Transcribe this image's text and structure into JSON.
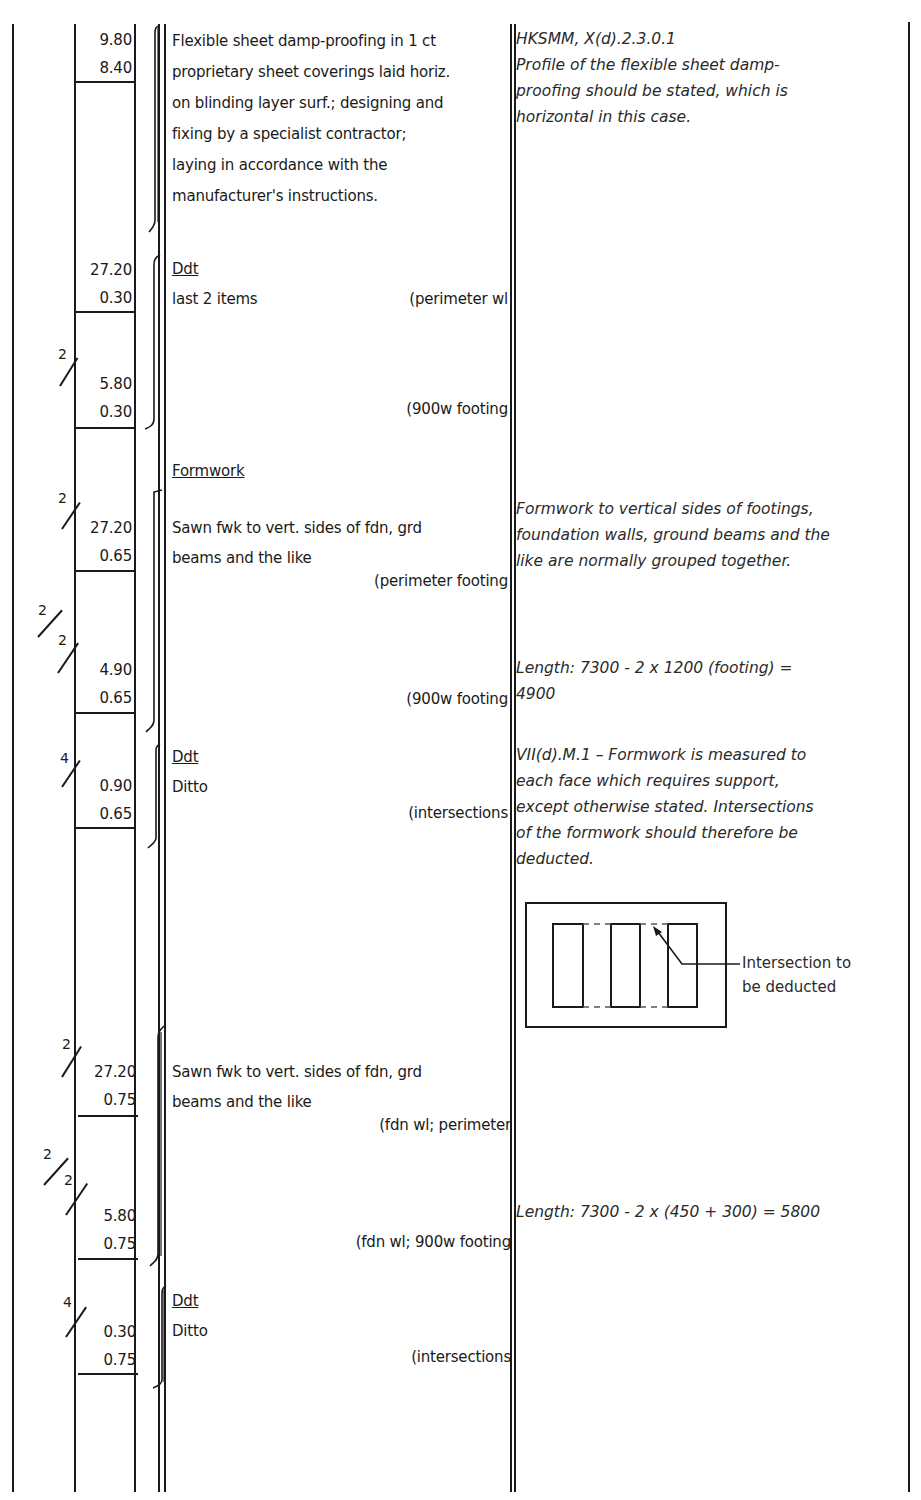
{
  "sheet": {
    "items": [
      {
        "timesing": "",
        "dims": [
          "9.80",
          "8.40"
        ],
        "heading": "",
        "description": [
          "Flexible sheet damp-proofing in 1 ct",
          "proprietary sheet coverings laid horiz.",
          "on blinding layer surf.; designing and",
          "fixing by a specialist contractor;",
          "laying in accordance with the",
          "manufacturer's instructions."
        ],
        "location": "",
        "note": [
          "HKSMM, X(d).2.3.0.1",
          "Profile of the flexible sheet damp-",
          "proofing should be stated, which is",
          "horizontal in this case."
        ]
      },
      {
        "timesing": "",
        "dims": [
          "27.20",
          "0.30"
        ],
        "heading": "Ddt",
        "description": [
          "last 2 items"
        ],
        "location": "(perimeter wl",
        "note": []
      },
      {
        "timesing": "2",
        "dims": [
          "5.80",
          "0.30"
        ],
        "heading": "",
        "description": [],
        "location": "(900w footing",
        "note": []
      },
      {
        "timesing": "2",
        "dims": [
          "27.20",
          "0.65"
        ],
        "heading": "Formwork",
        "description": [
          "Sawn fwk to vert. sides of fdn, grd",
          "beams and the like"
        ],
        "location": "(perimeter footing",
        "note": [
          "Formwork to vertical sides of footings,",
          "foundation walls, ground beams and the",
          "like are normally grouped together."
        ]
      },
      {
        "timesing": "2/2",
        "dims": [
          "4.90",
          "0.65"
        ],
        "heading": "",
        "description": [],
        "location": "(900w footing",
        "note": [
          "Length: 7300 - 2  x 1200 (footing) =",
          "4900"
        ]
      },
      {
        "timesing": "4",
        "dims": [
          "0.90",
          "0.65"
        ],
        "heading": "Ddt",
        "description": [
          "Ditto"
        ],
        "location": "(intersections",
        "note": [
          "VII(d).M.1 – Formwork is measured to",
          "each face which requires support,",
          "except otherwise stated. Intersections",
          "of the formwork should therefore be",
          "deducted."
        ]
      },
      {
        "timesing": "2",
        "dims": [
          "27.20",
          "0.75"
        ],
        "heading": "",
        "description": [
          "Sawn fwk to vert. sides of fdn, grd",
          "beams and the like"
        ],
        "location": "(fdn wl; perimeter",
        "note": []
      },
      {
        "timesing": "2/2",
        "dims": [
          "5.80",
          "0.75"
        ],
        "heading": "",
        "description": [],
        "location": "(fdn wl; 900w footing",
        "note": [
          "Length: 7300 - 2  x (450 + 300) = 5800"
        ]
      },
      {
        "timesing": "4",
        "dims": [
          "0.30",
          "0.75"
        ],
        "heading": "Ddt",
        "description": [
          "Ditto"
        ],
        "location": "(intersections",
        "note": []
      }
    ],
    "diagram": {
      "caption": [
        "Intersection to",
        "be deducted"
      ]
    }
  }
}
